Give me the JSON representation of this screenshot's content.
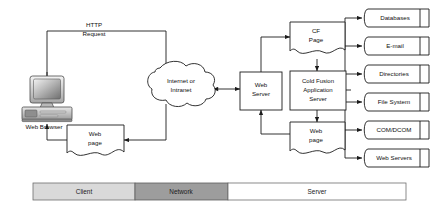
{
  "diagram": {
    "colors": {
      "stroke": "#1c1c1c",
      "shape_fill": "#ffffff",
      "band_client_fill": "#d9d9d9",
      "band_network_fill": "#9d9d9d",
      "band_server_fill": "#ffffff",
      "background": "#ffffff"
    },
    "client": {
      "workstation_caption": "Web Browser",
      "workstation_icon": "desktop-computer-icon",
      "request_label_line1": "HTTP",
      "request_label_line2": "Request",
      "response_page_line1": "Web",
      "response_page_line2": "page"
    },
    "network": {
      "cloud_line1": "Internet or",
      "cloud_line2": "Intranet",
      "cloud_icon": "cloud-icon"
    },
    "server": {
      "web_server_line1": "Web",
      "web_server_line2": "Server",
      "cf_page_line1": "CF",
      "cf_page_line2": "Page",
      "app_server_line1": "Cold Fusion",
      "app_server_line2": "Application",
      "app_server_line3": "Server",
      "result_page_line1": "Web",
      "result_page_line2": "page"
    },
    "resources": [
      {
        "label": "Databases"
      },
      {
        "label": "E-mail"
      },
      {
        "label": "Directories"
      },
      {
        "label": "File System"
      },
      {
        "label": "COM/DCOM"
      },
      {
        "label": "Web Servers"
      }
    ],
    "bands": [
      {
        "label": "Client",
        "zone": "client"
      },
      {
        "label": "Network",
        "zone": "network"
      },
      {
        "label": "Server",
        "zone": "server"
      }
    ]
  }
}
